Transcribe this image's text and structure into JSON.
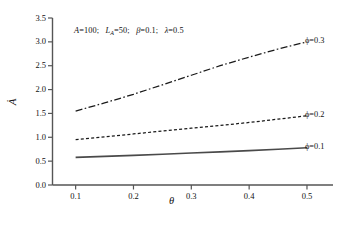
{
  "figure": {
    "background_color": "#ffffff",
    "caption_fragment": ""
  },
  "annotation": {
    "text": "A=100;  L_A=50;  β=0.1;  λ=0.5",
    "parts": [
      {
        "symbol": "A",
        "value": "100"
      },
      {
        "symbol": "L",
        "subscript": "A",
        "value": "50"
      },
      {
        "symbol": "β",
        "value": "0.1"
      },
      {
        "symbol": "λ",
        "value": "0.5"
      }
    ]
  },
  "axes": {
    "x_title": "θ",
    "y_title": "Ȧ",
    "x_ticks": [
      "0.1",
      "0.2",
      "0.3",
      "0.4",
      "0.5"
    ],
    "y_ticks": [
      "0.0",
      "0.5",
      "1.0",
      "1.5",
      "2.0",
      "2.5",
      "3.0",
      "3.5"
    ]
  },
  "legend": {
    "items": [
      {
        "label": "ϕ=0.3",
        "symbol": "ϕ",
        "value": "0.3",
        "style": "dash-dot",
        "color": "#1a1a1a"
      },
      {
        "label": "ϕ=0.2",
        "symbol": "ϕ",
        "value": "0.2",
        "style": "dotted",
        "color": "#1a1a1a"
      },
      {
        "label": "ϕ=0.1",
        "symbol": "ϕ",
        "value": "0.1",
        "style": "solid",
        "color": "#4a4a4a"
      }
    ]
  },
  "chart_data": {
    "type": "line",
    "title": "",
    "subtitle": "",
    "xlabel": "θ",
    "ylabel": "Ȧ",
    "xlim": [
      0.06,
      0.545
    ],
    "ylim": [
      0.0,
      3.5
    ],
    "xticks": [
      0.1,
      0.2,
      0.3,
      0.4,
      0.5
    ],
    "yticks": [
      0.0,
      0.5,
      1.0,
      1.5,
      2.0,
      2.5,
      3.0,
      3.5
    ],
    "grid": false,
    "legend_position": "right-inline",
    "annotations": [
      "A=100;  L_A=50;  β=0.1;  λ=0.5"
    ],
    "x": [
      0.1,
      0.15,
      0.2,
      0.25,
      0.3,
      0.35,
      0.4,
      0.45,
      0.5
    ],
    "series": [
      {
        "name": "ϕ=0.3",
        "linestyle": "dash-dot",
        "color": "#1a1a1a",
        "values": [
          1.55,
          1.72,
          1.9,
          2.1,
          2.3,
          2.5,
          2.68,
          2.85,
          3.0
        ]
      },
      {
        "name": "ϕ=0.2",
        "linestyle": "dotted",
        "color": "#1a1a1a",
        "values": [
          0.95,
          1.01,
          1.07,
          1.13,
          1.19,
          1.25,
          1.31,
          1.38,
          1.45
        ]
      },
      {
        "name": "ϕ=0.1",
        "linestyle": "solid",
        "color": "#4a4a4a",
        "values": [
          0.58,
          0.6,
          0.62,
          0.645,
          0.67,
          0.695,
          0.72,
          0.75,
          0.78
        ]
      }
    ]
  }
}
